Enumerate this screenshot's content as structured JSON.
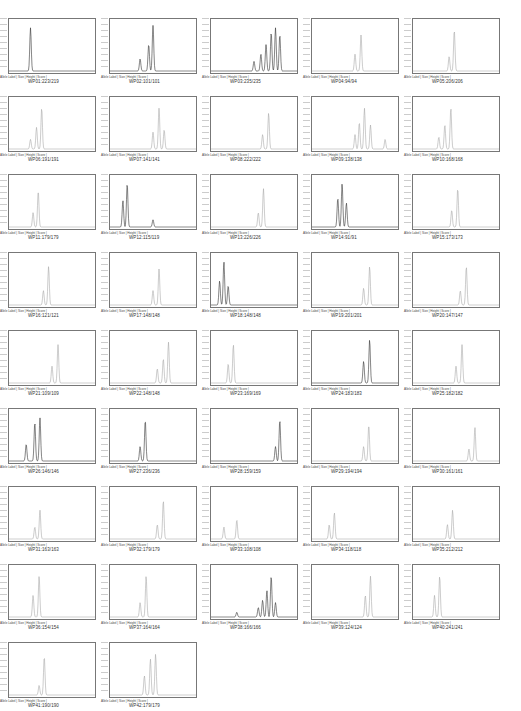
{
  "figure": {
    "meta_label": "Allele Label | Size | Height | Score |",
    "panels": [
      {
        "name": "WP01:223/219",
        "peaks": [
          [
            0.25,
            0.9
          ]
        ],
        "dark": true
      },
      {
        "name": "WP02:101/101",
        "peaks": [
          [
            0.35,
            0.25
          ],
          [
            0.45,
            0.55
          ],
          [
            0.5,
            0.95
          ]
        ],
        "dark": true
      },
      {
        "name": "WP03:235/235",
        "peaks": [
          [
            0.5,
            0.2
          ],
          [
            0.58,
            0.35
          ],
          [
            0.64,
            0.55
          ],
          [
            0.7,
            0.8
          ],
          [
            0.75,
            0.9
          ],
          [
            0.8,
            0.75
          ]
        ],
        "dark": true
      },
      {
        "name": "WP04:94/94",
        "peaks": [
          [
            0.5,
            0.35
          ],
          [
            0.57,
            0.75
          ]
        ],
        "dark": false
      },
      {
        "name": "WP05:206/206",
        "peaks": [
          [
            0.42,
            0.3
          ],
          [
            0.48,
            0.85
          ]
        ],
        "dark": false
      },
      {
        "name": "WP06:191/191",
        "peaks": [
          [
            0.25,
            0.2
          ],
          [
            0.32,
            0.45
          ],
          [
            0.38,
            0.85
          ]
        ],
        "dark": false
      },
      {
        "name": "WP07:141/141",
        "peaks": [
          [
            0.5,
            0.35
          ],
          [
            0.57,
            0.85
          ],
          [
            0.63,
            0.4
          ]
        ],
        "dark": false
      },
      {
        "name": "WP08:222/222",
        "peaks": [
          [
            0.6,
            0.3
          ],
          [
            0.67,
            0.75
          ]
        ],
        "dark": false
      },
      {
        "name": "WP09:138/138",
        "peaks": [
          [
            0.5,
            0.3
          ],
          [
            0.55,
            0.55
          ],
          [
            0.61,
            0.85
          ],
          [
            0.68,
            0.5
          ],
          [
            0.85,
            0.2
          ]
        ],
        "dark": false
      },
      {
        "name": "WP10:168/168",
        "peaks": [
          [
            0.3,
            0.25
          ],
          [
            0.37,
            0.5
          ],
          [
            0.44,
            0.85
          ]
        ],
        "dark": false
      },
      {
        "name": "WP11:179/179",
        "peaks": [
          [
            0.28,
            0.3
          ],
          [
            0.34,
            0.75
          ]
        ],
        "dark": false
      },
      {
        "name": "WP12:115/119",
        "peaks": [
          [
            0.15,
            0.55
          ],
          [
            0.2,
            0.9
          ],
          [
            0.5,
            0.15
          ]
        ],
        "dark": true
      },
      {
        "name": "WP13:226/226",
        "peaks": [
          [
            0.55,
            0.3
          ],
          [
            0.61,
            0.8
          ]
        ],
        "dark": false
      },
      {
        "name": "WP14:91/91",
        "peaks": [
          [
            0.3,
            0.6
          ],
          [
            0.35,
            0.9
          ],
          [
            0.4,
            0.5
          ]
        ],
        "dark": true
      },
      {
        "name": "WP15:173/173",
        "peaks": [
          [
            0.45,
            0.35
          ],
          [
            0.52,
            0.8
          ]
        ],
        "dark": false
      },
      {
        "name": "WP16:121/121",
        "peaks": [
          [
            0.4,
            0.3
          ],
          [
            0.46,
            0.8
          ]
        ],
        "dark": false
      },
      {
        "name": "WP17:148/148",
        "peaks": [
          [
            0.5,
            0.3
          ],
          [
            0.57,
            0.75
          ]
        ],
        "dark": false
      },
      {
        "name": "WP18:148/148",
        "peaks": [
          [
            0.1,
            0.5
          ],
          [
            0.15,
            0.9
          ],
          [
            0.2,
            0.4
          ]
        ],
        "dark": true
      },
      {
        "name": "WP19:201/201",
        "peaks": [
          [
            0.6,
            0.35
          ],
          [
            0.67,
            0.8
          ]
        ],
        "dark": false
      },
      {
        "name": "WP20:147/147",
        "peaks": [
          [
            0.55,
            0.3
          ],
          [
            0.62,
            0.8
          ]
        ],
        "dark": false
      },
      {
        "name": "WP21:109/109",
        "peaks": [
          [
            0.5,
            0.35
          ],
          [
            0.57,
            0.8
          ]
        ],
        "dark": false
      },
      {
        "name": "WP22:148/148",
        "peaks": [
          [
            0.55,
            0.3
          ],
          [
            0.62,
            0.5
          ],
          [
            0.68,
            0.85
          ]
        ],
        "dark": false
      },
      {
        "name": "WP23:169/169",
        "peaks": [
          [
            0.2,
            0.4
          ],
          [
            0.26,
            0.8
          ]
        ],
        "dark": false
      },
      {
        "name": "WP24:183/183",
        "peaks": [
          [
            0.6,
            0.45
          ],
          [
            0.67,
            0.9
          ]
        ],
        "dark": true
      },
      {
        "name": "WP25:182/182",
        "peaks": [
          [
            0.5,
            0.35
          ],
          [
            0.57,
            0.8
          ]
        ],
        "dark": false
      },
      {
        "name": "WP26:146/146",
        "peaks": [
          [
            0.2,
            0.35
          ],
          [
            0.3,
            0.8
          ],
          [
            0.36,
            0.9
          ]
        ],
        "dark": true
      },
      {
        "name": "WP27:236/236",
        "peaks": [
          [
            0.35,
            0.3
          ],
          [
            0.41,
            0.85
          ]
        ],
        "dark": true
      },
      {
        "name": "WP28:159/159",
        "peaks": [
          [
            0.75,
            0.3
          ],
          [
            0.8,
            0.85
          ]
        ],
        "dark": true
      },
      {
        "name": "WP29:194/194",
        "peaks": [
          [
            0.6,
            0.3
          ],
          [
            0.66,
            0.75
          ]
        ],
        "dark": false
      },
      {
        "name": "WP30:161/161",
        "peaks": [
          [
            0.65,
            0.25
          ],
          [
            0.72,
            0.7
          ]
        ],
        "dark": false
      },
      {
        "name": "WP31:163/163",
        "peaks": [
          [
            0.3,
            0.25
          ],
          [
            0.36,
            0.6
          ]
        ],
        "dark": false
      },
      {
        "name": "WP32:179/179",
        "peaks": [
          [
            0.55,
            0.3
          ],
          [
            0.62,
            0.8
          ]
        ],
        "dark": false
      },
      {
        "name": "WP33:108/108",
        "peaks": [
          [
            0.15,
            0.25
          ],
          [
            0.3,
            0.4
          ]
        ],
        "dark": false
      },
      {
        "name": "WP34:118/118",
        "peaks": [
          [
            0.2,
            0.3
          ],
          [
            0.26,
            0.55
          ]
        ],
        "dark": false
      },
      {
        "name": "WP35:212/212",
        "peaks": [
          [
            0.4,
            0.3
          ],
          [
            0.46,
            0.6
          ]
        ],
        "dark": false
      },
      {
        "name": "WP36:154/154",
        "peaks": [
          [
            0.28,
            0.45
          ],
          [
            0.35,
            0.85
          ]
        ],
        "dark": false
      },
      {
        "name": "WP37:164/164",
        "peaks": [
          [
            0.35,
            0.3
          ],
          [
            0.42,
            0.85
          ]
        ],
        "dark": false
      },
      {
        "name": "WP38:166/166",
        "peaks": [
          [
            0.3,
            0.1
          ],
          [
            0.55,
            0.2
          ],
          [
            0.6,
            0.35
          ],
          [
            0.65,
            0.55
          ],
          [
            0.7,
            0.85
          ],
          [
            0.75,
            0.3
          ]
        ],
        "dark": true
      },
      {
        "name": "WP39:124/124",
        "peaks": [
          [
            0.62,
            0.45
          ],
          [
            0.68,
            0.85
          ]
        ],
        "dark": false
      },
      {
        "name": "WP40:241/241",
        "peaks": [
          [
            0.25,
            0.45
          ],
          [
            0.31,
            0.85
          ]
        ],
        "dark": false
      },
      {
        "name": "WP41:190/190",
        "peaks": [
          [
            0.35,
            0.2
          ],
          [
            0.41,
            0.8
          ]
        ],
        "dark": false
      },
      {
        "name": "WP42:179/179",
        "peaks": [
          [
            0.4,
            0.4
          ],
          [
            0.47,
            0.75
          ],
          [
            0.53,
            0.85
          ]
        ],
        "dark": false
      }
    ]
  }
}
